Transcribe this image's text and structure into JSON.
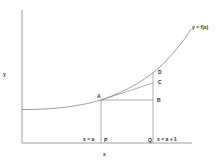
{
  "diagram": {
    "axis_labels": {
      "x": "x",
      "y": "y"
    },
    "curve_label": "y = f(x)",
    "points": {
      "A": "A",
      "B": "B",
      "C": "C",
      "D": "D",
      "P": "P",
      "Q": "Q"
    },
    "x_markers": {
      "left": "x = a",
      "right": "x = a + 1"
    },
    "colors": {
      "line": "#666666",
      "text": "#333333",
      "background": "#ffffff"
    }
  }
}
